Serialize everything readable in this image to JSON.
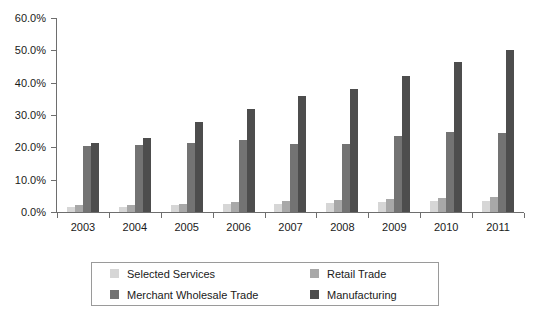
{
  "chart_data": {
    "type": "bar",
    "title": "",
    "subtitle": "",
    "xlabel": "",
    "ylabel": "",
    "categories": [
      "2003",
      "2004",
      "2005",
      "2006",
      "2007",
      "2008",
      "2009",
      "2010",
      "2011"
    ],
    "series": [
      {
        "name": "Selected Services",
        "color": "#d6d6d6",
        "values": [
          1.4,
          1.6,
          2.1,
          2.4,
          2.5,
          2.8,
          3.0,
          3.3,
          3.4
        ]
      },
      {
        "name": "Retail Trade",
        "color": "#a8a8a8",
        "values": [
          2.2,
          2.3,
          2.6,
          3.1,
          3.5,
          3.7,
          3.9,
          4.3,
          4.5
        ]
      },
      {
        "name": "Merchant Wholesale Trade",
        "color": "#737373",
        "values": [
          20.4,
          20.7,
          21.4,
          22.3,
          21.1,
          21.0,
          23.4,
          24.6,
          24.3
        ]
      },
      {
        "name": "Manufacturing",
        "color": "#4d4d4d",
        "values": [
          21.2,
          23.0,
          27.8,
          31.9,
          36.0,
          38.0,
          42.0,
          46.4,
          50.0
        ]
      }
    ],
    "ylim": [
      0,
      60
    ],
    "ytick_labels": [
      "0.0%",
      "10.0%",
      "20.0%",
      "30.0%",
      "40.0%",
      "50.0%",
      "60.0%"
    ],
    "ytick_values": [
      0,
      10,
      20,
      30,
      40,
      50,
      60
    ],
    "grid": false,
    "legend_position": "bottom"
  }
}
